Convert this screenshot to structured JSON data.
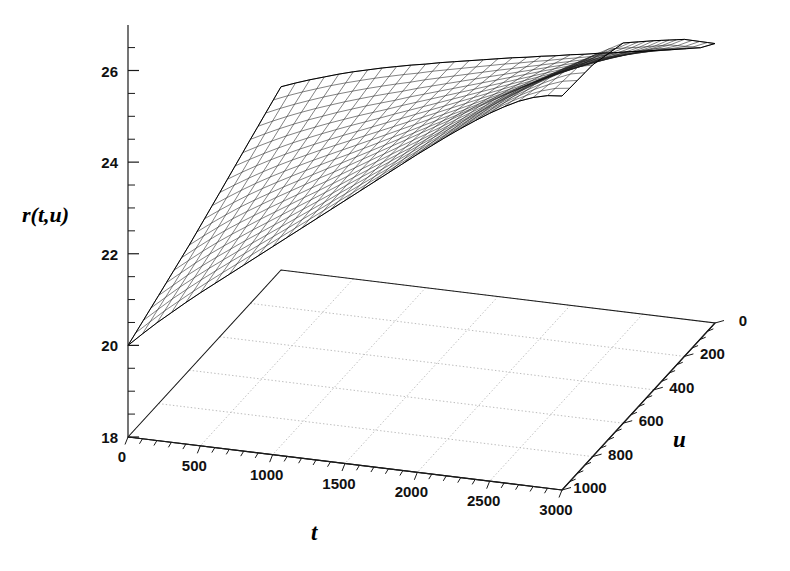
{
  "figure": {
    "kind": "3d-surface-wireframe",
    "background": "#ffffff",
    "ink": "#1a1a1a",
    "grid_color": "#b4b4b4"
  },
  "labels": {
    "z_axis": "r(t,u)",
    "x_axis": "t",
    "y_axis": "u"
  },
  "axes": {
    "z": {
      "label": "r(t,u)",
      "major_ticks": [
        18,
        20,
        22,
        24,
        26
      ],
      "major_tick_labels": [
        "18",
        "20",
        "22",
        "24",
        "26"
      ],
      "minor_step": 0.5,
      "range": [
        18,
        27
      ]
    },
    "t": {
      "label": "t",
      "major_ticks": [
        0,
        500,
        1000,
        1500,
        2000,
        2500,
        3000
      ],
      "major_tick_labels": [
        "0",
        "500",
        "1000",
        "1500",
        "2000",
        "2500",
        "3000"
      ],
      "minor_step": 100,
      "range": [
        0,
        3000
      ]
    },
    "u": {
      "label": "u",
      "major_ticks": [
        0,
        200,
        400,
        600,
        800,
        1000
      ],
      "major_tick_labels": [
        "0",
        "200",
        "400",
        "600",
        "800",
        "1000"
      ],
      "minor_step": 50,
      "range": [
        0,
        1000
      ]
    }
  },
  "chart_data": {
    "type": "surface",
    "title": "",
    "xlabel": "t",
    "ylabel": "u",
    "zlabel": "r(t,u)",
    "xlim": [
      0,
      3000
    ],
    "ylim": [
      0,
      1000
    ],
    "zlim": [
      18,
      27
    ],
    "grid": true,
    "legend": "none",
    "base_grid_drawn_at_z": 18,
    "mesh": {
      "nt": 31,
      "nu": 21
    },
    "x": [
      0,
      100,
      200,
      300,
      400,
      500,
      600,
      700,
      800,
      900,
      1000,
      1100,
      1200,
      1300,
      1400,
      1500,
      1600,
      1700,
      1800,
      1900,
      2000,
      2100,
      2200,
      2300,
      2400,
      2500,
      2600,
      2700,
      2800,
      2900,
      3000
    ],
    "y": [
      0,
      50,
      100,
      150,
      200,
      250,
      300,
      350,
      400,
      450,
      500,
      550,
      600,
      650,
      700,
      750,
      800,
      850,
      900,
      950,
      1000
    ],
    "z_surface_description": "Monotone-increasing saddle in t with a twist (pivot) near t=1000 where the u-curves cross; r rises from about 20.0 at (t=0,u=1000) and about 22.0 at (t=0,u=0) to about 24.0-26.6 at t=3000.",
    "z_corners": {
      "t0_u0": 22.0,
      "t0_u1000": 20.0,
      "t3000_u0": 24.1,
      "t3000_u1000": 26.6
    },
    "z_profiles": [
      {
        "name": "u=0",
        "u": 0,
        "values": [
          22.0,
          22.12,
          22.23,
          22.33,
          22.43,
          22.52,
          22.6,
          22.68,
          22.75,
          22.82,
          22.88,
          22.95,
          23.01,
          23.07,
          23.13,
          23.19,
          23.25,
          23.3,
          23.36,
          23.41,
          23.47,
          23.52,
          23.58,
          23.63,
          23.69,
          23.74,
          23.8,
          23.85,
          23.91,
          23.97,
          24.1
        ]
      },
      {
        "name": "u=200",
        "u": 200,
        "values": [
          21.58,
          21.74,
          21.89,
          22.03,
          22.16,
          22.28,
          22.4,
          22.51,
          22.62,
          22.72,
          22.82,
          22.93,
          23.03,
          23.13,
          23.23,
          23.33,
          23.43,
          23.53,
          23.63,
          23.73,
          23.83,
          23.93,
          24.03,
          24.13,
          24.23,
          24.33,
          24.43,
          24.53,
          24.64,
          24.76,
          24.92
        ]
      },
      {
        "name": "u=400",
        "u": 400,
        "values": [
          21.15,
          21.35,
          21.54,
          21.72,
          21.89,
          22.05,
          22.2,
          22.35,
          22.49,
          22.63,
          22.77,
          22.91,
          23.05,
          23.19,
          23.33,
          23.47,
          23.61,
          23.75,
          23.89,
          24.03,
          24.17,
          24.31,
          24.45,
          24.59,
          24.73,
          24.87,
          25.01,
          25.15,
          25.29,
          25.44,
          25.62
        ]
      },
      {
        "name": "u=600",
        "u": 600,
        "values": [
          20.73,
          20.97,
          21.2,
          21.42,
          21.62,
          21.81,
          22.0,
          22.18,
          22.36,
          22.54,
          22.71,
          22.89,
          23.07,
          23.25,
          23.43,
          23.61,
          23.79,
          23.97,
          24.15,
          24.34,
          24.52,
          24.7,
          24.88,
          25.06,
          25.24,
          25.42,
          25.6,
          25.78,
          25.96,
          26.13,
          26.3
        ]
      },
      {
        "name": "u=800",
        "u": 800,
        "values": [
          20.36,
          20.62,
          20.88,
          21.12,
          21.35,
          21.57,
          21.79,
          22.0,
          22.21,
          22.42,
          22.63,
          22.84,
          23.05,
          23.27,
          23.48,
          23.69,
          23.9,
          24.11,
          24.33,
          24.54,
          24.75,
          24.96,
          25.17,
          25.38,
          25.58,
          25.78,
          25.97,
          26.15,
          26.32,
          26.47,
          26.55
        ]
      },
      {
        "name": "u=1000",
        "u": 1000,
        "values": [
          20.0,
          20.29,
          20.57,
          20.83,
          21.09,
          21.34,
          21.58,
          21.82,
          22.06,
          22.3,
          22.54,
          22.78,
          23.02,
          23.26,
          23.5,
          23.74,
          23.98,
          24.22,
          24.46,
          24.7,
          24.94,
          25.17,
          25.4,
          25.62,
          25.83,
          26.03,
          26.21,
          26.37,
          26.49,
          26.57,
          26.6
        ]
      }
    ]
  }
}
